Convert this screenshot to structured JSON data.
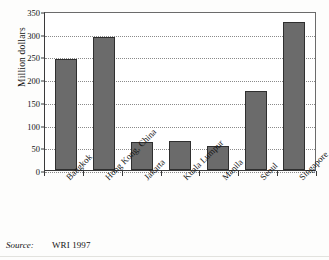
{
  "chart_data": {
    "type": "bar",
    "title": "",
    "xlabel": "",
    "ylabel": "Million dollars",
    "ylim": [
      0,
      350
    ],
    "yticks": [
      0,
      50,
      100,
      150,
      200,
      250,
      300,
      350
    ],
    "ytick_labels": [
      "0",
      "50",
      "100",
      "150",
      "200",
      "250",
      "300",
      "350"
    ],
    "grid": "horizontal-dotted",
    "legend": "none",
    "categories": [
      "Bangkok",
      "Hong Kong, China",
      "Jakarta",
      "Kuala Lumpur",
      "Manila",
      "Seoul",
      "Singapore"
    ],
    "values": [
      245,
      293,
      62,
      64,
      53,
      175,
      325
    ],
    "bar_color": "#6b6b6b",
    "bar_edge_color": "#2f2f2f"
  },
  "source": {
    "label": "Source:",
    "value": "WRI 1997"
  }
}
